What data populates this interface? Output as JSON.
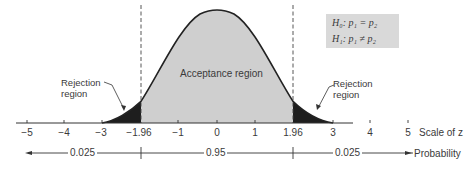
{
  "diagram": {
    "hypotheses": {
      "h0": "H₀: p₁ = p₂",
      "h1": "H₁: p₁ ≠ p₂"
    },
    "regions": {
      "acceptance": "Acceptance region",
      "rejection_left_line1": "Rejection",
      "rejection_left_line2": "region",
      "rejection_right_line1": "Rejection",
      "rejection_right_line2": "region"
    },
    "axis": {
      "label": "Scale of z",
      "ticks": [
        "−5",
        "−4",
        "−3",
        "−1.96",
        "−1",
        "0",
        "1",
        "1.96",
        "3",
        "4",
        "5"
      ]
    },
    "probability": {
      "left": "0.025",
      "middle": "0.95",
      "right": "0.025",
      "label": "Probability"
    },
    "colors": {
      "acceptance_fill": "#cfcfcf",
      "rejection_fill": "#1e1e1e",
      "curve": "#222222",
      "hypothesis_box": "#d9d9d9"
    }
  }
}
